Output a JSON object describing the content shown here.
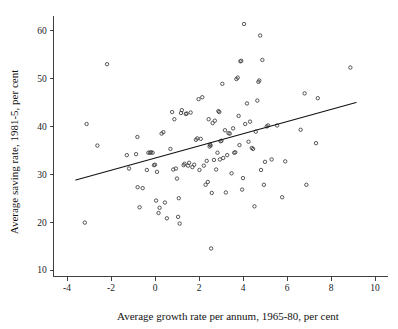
{
  "chart_data": {
    "type": "scatter",
    "title": "",
    "xlabel": "Average growth rate per annum, 1965-80, per cent",
    "ylabel": "Average saving rate, 1981-5, per cent",
    "xlim": [
      -4.6,
      10.6
    ],
    "ylim": [
      8.6,
      63.0
    ],
    "xticks": [
      -4,
      -2,
      0,
      2,
      4,
      6,
      8,
      10
    ],
    "xtick_labels": [
      "-4",
      "-2",
      "0",
      "2",
      "4",
      "6",
      "8",
      "10"
    ],
    "yticks": [
      10,
      20,
      30,
      40,
      50,
      60
    ],
    "ytick_labels": [
      "10",
      "20",
      "30",
      "40",
      "50",
      "60"
    ],
    "grid": false,
    "legend": null,
    "marker": "open-circle",
    "marker_color": "#3a3a3a",
    "line_color": "#111111",
    "background": "#ffffff",
    "fit_line": {
      "name": "linear fit",
      "x": [
        -3.6,
        9.14
      ],
      "y": [
        28.8,
        45.0
      ],
      "slope": 1.27,
      "intercept": 33.4
    },
    "points": [
      [
        -3.19,
        19.9
      ],
      [
        -3.11,
        40.5
      ],
      [
        -2.62,
        36.0
      ],
      [
        -2.18,
        53.0
      ],
      [
        -1.28,
        34.0
      ],
      [
        -1.18,
        31.2
      ],
      [
        -0.86,
        34.2
      ],
      [
        -0.8,
        37.8
      ],
      [
        -0.79,
        27.3
      ],
      [
        -0.7,
        23.1
      ],
      [
        -0.56,
        27.1
      ],
      [
        -0.37,
        30.9
      ],
      [
        -0.3,
        34.5
      ],
      [
        -0.23,
        34.5
      ],
      [
        -0.18,
        34.6
      ],
      [
        -0.11,
        34.5
      ],
      [
        -0.05,
        31.9
      ],
      [
        0.0,
        32.0
      ],
      [
        0.05,
        24.5
      ],
      [
        0.09,
        30.5
      ],
      [
        0.16,
        21.9
      ],
      [
        0.21,
        23.0
      ],
      [
        0.3,
        38.5
      ],
      [
        0.38,
        38.8
      ],
      [
        0.45,
        24.1
      ],
      [
        0.54,
        20.8
      ],
      [
        0.7,
        35.3
      ],
      [
        0.78,
        43.0
      ],
      [
        0.83,
        31.0
      ],
      [
        0.88,
        41.5
      ],
      [
        0.95,
        31.2
      ],
      [
        1.0,
        29.1
      ],
      [
        1.05,
        21.1
      ],
      [
        1.08,
        25.0
      ],
      [
        1.12,
        19.7
      ],
      [
        1.18,
        42.8
      ],
      [
        1.22,
        43.4
      ],
      [
        1.3,
        31.9
      ],
      [
        1.34,
        32.2
      ],
      [
        1.4,
        42.6
      ],
      [
        1.44,
        42.7
      ],
      [
        1.5,
        31.8
      ],
      [
        1.55,
        32.4
      ],
      [
        1.62,
        42.9
      ],
      [
        1.7,
        31.5
      ],
      [
        1.78,
        32.0
      ],
      [
        1.86,
        37.2
      ],
      [
        1.92,
        37.5
      ],
      [
        1.98,
        45.7
      ],
      [
        2.02,
        30.9
      ],
      [
        2.08,
        37.4
      ],
      [
        2.15,
        46.1
      ],
      [
        2.22,
        31.8
      ],
      [
        2.3,
        27.8
      ],
      [
        2.35,
        32.8
      ],
      [
        2.4,
        28.4
      ],
      [
        2.44,
        41.5
      ],
      [
        2.48,
        35.8
      ],
      [
        2.5,
        36.2
      ],
      [
        2.53,
        36.0
      ],
      [
        2.55,
        14.5
      ],
      [
        2.58,
        26.1
      ],
      [
        2.62,
        40.7
      ],
      [
        2.68,
        33.0
      ],
      [
        2.72,
        41.2
      ],
      [
        2.78,
        31.0
      ],
      [
        2.84,
        34.5
      ],
      [
        2.88,
        43.2
      ],
      [
        2.92,
        43.0
      ],
      [
        2.95,
        33.1
      ],
      [
        2.98,
        36.9
      ],
      [
        3.02,
        37.0
      ],
      [
        3.06,
        48.9
      ],
      [
        3.1,
        33.4
      ],
      [
        3.18,
        39.2
      ],
      [
        3.22,
        26.2
      ],
      [
        3.28,
        34.0
      ],
      [
        3.34,
        38.6
      ],
      [
        3.4,
        38.5
      ],
      [
        3.48,
        30.2
      ],
      [
        3.55,
        39.6
      ],
      [
        3.6,
        34.5
      ],
      [
        3.65,
        34.6
      ],
      [
        3.7,
        49.9
      ],
      [
        3.76,
        50.2
      ],
      [
        3.8,
        42.2
      ],
      [
        3.84,
        36.1
      ],
      [
        3.88,
        53.6
      ],
      [
        3.92,
        53.7
      ],
      [
        3.96,
        26.8
      ],
      [
        4.0,
        29.2
      ],
      [
        4.05,
        61.4
      ],
      [
        4.1,
        40.5
      ],
      [
        4.18,
        44.8
      ],
      [
        4.25,
        36.8
      ],
      [
        4.32,
        41.0
      ],
      [
        4.4,
        35.5
      ],
      [
        4.46,
        35.3
      ],
      [
        4.52,
        23.3
      ],
      [
        4.58,
        38.9
      ],
      [
        4.65,
        45.4
      ],
      [
        4.7,
        49.3
      ],
      [
        4.74,
        49.6
      ],
      [
        4.78,
        59.0
      ],
      [
        4.82,
        30.9
      ],
      [
        4.88,
        53.9
      ],
      [
        4.95,
        27.8
      ],
      [
        5.0,
        32.6
      ],
      [
        5.08,
        40.0
      ],
      [
        5.14,
        40.2
      ],
      [
        5.3,
        33.1
      ],
      [
        5.55,
        40.2
      ],
      [
        5.78,
        25.2
      ],
      [
        5.92,
        32.7
      ],
      [
        6.62,
        39.3
      ],
      [
        6.8,
        46.9
      ],
      [
        6.88,
        27.8
      ],
      [
        7.32,
        36.5
      ],
      [
        7.4,
        45.9
      ],
      [
        8.88,
        52.3
      ]
    ]
  }
}
